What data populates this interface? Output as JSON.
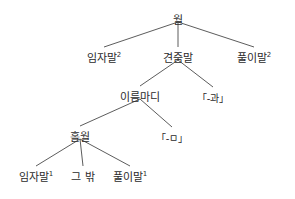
{
  "diagram": {
    "type": "syntax-tree",
    "background_color": "#ffffff",
    "line_color": "#4a4a4a",
    "text_color": "#2b2b2b",
    "nodes": [
      {
        "id": "n0",
        "label": "월",
        "sup": "",
        "x": 178,
        "y": 14,
        "level": 0
      },
      {
        "id": "n1",
        "label": "임자말",
        "sup": "2",
        "x": 104,
        "y": 52,
        "level": 1
      },
      {
        "id": "n2",
        "label": "견줌말",
        "sup": "",
        "x": 178,
        "y": 52,
        "level": 1
      },
      {
        "id": "n3",
        "label": "풀이말",
        "sup": "2",
        "x": 254,
        "y": 52,
        "level": 1
      },
      {
        "id": "n4",
        "label": "이름마디",
        "sup": "",
        "x": 140,
        "y": 91,
        "level": 2
      },
      {
        "id": "n5",
        "label": "「-과」",
        "sup": "",
        "x": 213,
        "y": 92,
        "level": 2
      },
      {
        "id": "n6",
        "label": "홀월",
        "sup": "",
        "x": 80,
        "y": 131,
        "level": 3
      },
      {
        "id": "n7",
        "label": "「-ㅁ」",
        "sup": "",
        "x": 172,
        "y": 132,
        "level": 3
      },
      {
        "id": "n8",
        "label": "임자말",
        "sup": "1",
        "x": 36,
        "y": 171,
        "level": 4
      },
      {
        "id": "n9",
        "label": "그 밖",
        "sup": "",
        "x": 83,
        "y": 171,
        "level": 4
      },
      {
        "id": "n10",
        "label": "풀이말",
        "sup": "1",
        "x": 130,
        "y": 171,
        "level": 4
      }
    ],
    "edges": [
      {
        "from": "n0",
        "to": "n1"
      },
      {
        "from": "n0",
        "to": "n2"
      },
      {
        "from": "n0",
        "to": "n3"
      },
      {
        "from": "n2",
        "to": "n4"
      },
      {
        "from": "n2",
        "to": "n5"
      },
      {
        "from": "n4",
        "to": "n6"
      },
      {
        "from": "n4",
        "to": "n7"
      },
      {
        "from": "n6",
        "to": "n8"
      },
      {
        "from": "n6",
        "to": "n9"
      },
      {
        "from": "n6",
        "to": "n10"
      }
    ]
  }
}
